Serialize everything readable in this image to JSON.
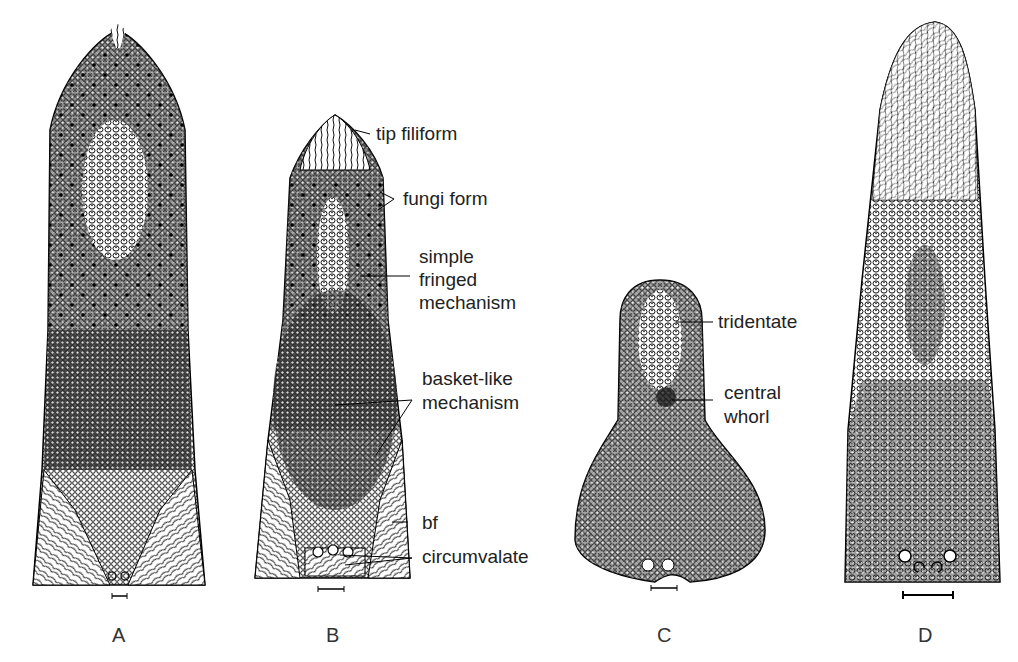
{
  "figure": {
    "panels": [
      {
        "id": "A",
        "label": "A"
      },
      {
        "id": "B",
        "label": "B"
      },
      {
        "id": "C",
        "label": "C"
      },
      {
        "id": "D",
        "label": "D"
      }
    ],
    "annotations_B": {
      "tip_filiform": "tip filiform",
      "fungi_form": "fungi form",
      "simple_line1": "simple",
      "simple_line2": "fringed",
      "simple_line3": "mechanism",
      "basket_line1": "basket-like",
      "basket_line2": "mechanism",
      "bf": "bf",
      "circumvalate": "circumvalate"
    },
    "annotations_C": {
      "tridentate": "tridentate",
      "central_line1": "central",
      "central_line2": "whorl"
    }
  }
}
